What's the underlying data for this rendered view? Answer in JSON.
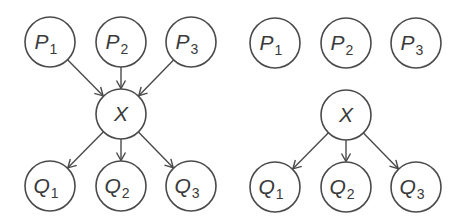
{
  "diagram": {
    "stroke_color": "#4a4a4a",
    "node_radius": 25,
    "panels": [
      {
        "name": "connected",
        "nodes": [
          {
            "id": "P1",
            "letter": "P",
            "sub": "1",
            "cx": 50,
            "cy": 42
          },
          {
            "id": "P2",
            "letter": "P",
            "sub": "2",
            "cx": 121,
            "cy": 42
          },
          {
            "id": "P3",
            "letter": "P",
            "sub": "3",
            "cx": 191,
            "cy": 42
          },
          {
            "id": "X",
            "letter": "X",
            "sub": "",
            "cx": 121,
            "cy": 114
          },
          {
            "id": "Q1",
            "letter": "Q",
            "sub": "1",
            "cx": 50,
            "cy": 186
          },
          {
            "id": "Q2",
            "letter": "Q",
            "sub": "2",
            "cx": 121,
            "cy": 186
          },
          {
            "id": "Q3",
            "letter": "Q",
            "sub": "3",
            "cx": 191,
            "cy": 186
          }
        ],
        "edges": [
          {
            "from": "P1",
            "to": "X"
          },
          {
            "from": "P2",
            "to": "X"
          },
          {
            "from": "P3",
            "to": "X"
          },
          {
            "from": "X",
            "to": "Q1"
          },
          {
            "from": "X",
            "to": "Q2"
          },
          {
            "from": "X",
            "to": "Q3"
          }
        ]
      },
      {
        "name": "disconnected",
        "nodes": [
          {
            "id": "P1",
            "letter": "P",
            "sub": "1",
            "cx": 275,
            "cy": 43
          },
          {
            "id": "P2",
            "letter": "P",
            "sub": "2",
            "cx": 346,
            "cy": 43
          },
          {
            "id": "P3",
            "letter": "P",
            "sub": "3",
            "cx": 416,
            "cy": 43
          },
          {
            "id": "X",
            "letter": "X",
            "sub": "",
            "cx": 346,
            "cy": 115
          },
          {
            "id": "Q1",
            "letter": "Q",
            "sub": "1",
            "cx": 275,
            "cy": 187
          },
          {
            "id": "Q2",
            "letter": "Q",
            "sub": "2",
            "cx": 346,
            "cy": 187
          },
          {
            "id": "Q3",
            "letter": "Q",
            "sub": "3",
            "cx": 416,
            "cy": 187
          }
        ],
        "edges": [
          {
            "from": "X",
            "to": "Q1"
          },
          {
            "from": "X",
            "to": "Q2"
          },
          {
            "from": "X",
            "to": "Q3"
          }
        ]
      }
    ]
  }
}
